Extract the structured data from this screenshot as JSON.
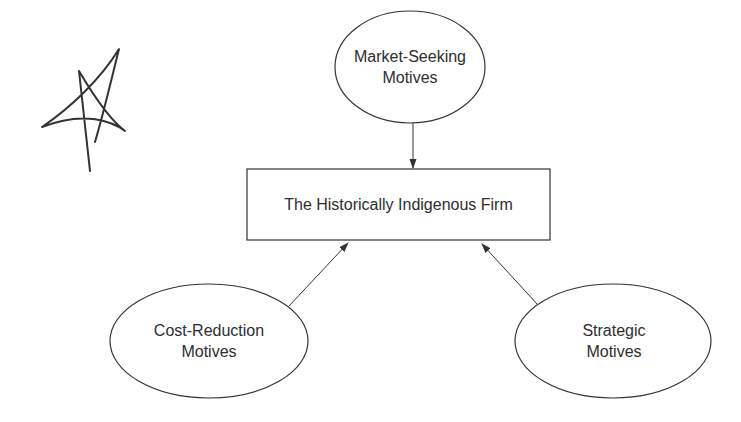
{
  "diagram": {
    "center_node": {
      "label": "The Historically Indigenous Firm"
    },
    "nodes": [
      {
        "id": "market",
        "line1": "Market-Seeking",
        "line2": "Motives"
      },
      {
        "id": "cost",
        "line1": "Cost-Reduction",
        "line2": "Motives"
      },
      {
        "id": "strategic",
        "line1": "Strategic",
        "line2": "Motives"
      }
    ],
    "edges": [
      {
        "from": "market",
        "to": "center"
      },
      {
        "from": "cost",
        "to": "center"
      },
      {
        "from": "strategic",
        "to": "center"
      }
    ],
    "annotation": {
      "type": "handwritten-star-mark"
    },
    "colors": {
      "stroke": "#333333",
      "text": "#2e2e2e",
      "background": "#ffffff"
    }
  }
}
